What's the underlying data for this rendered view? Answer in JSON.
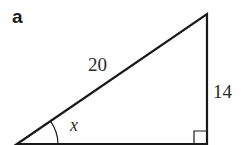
{
  "figure": {
    "part_label": "a",
    "triangle": {
      "type": "right-triangle",
      "vertices": {
        "bottom_left": [
          17,
          144
        ],
        "top_right": [
          207,
          14
        ],
        "bottom_right": [
          207,
          144
        ]
      },
      "right_angle_at": "bottom_right",
      "hypotenuse_label": "20",
      "vertical_side_label": "14",
      "angle_label": "x",
      "angle_at": "bottom_left"
    },
    "colors": {
      "stroke": "#1a1a1a",
      "background": "#ffffff"
    }
  }
}
